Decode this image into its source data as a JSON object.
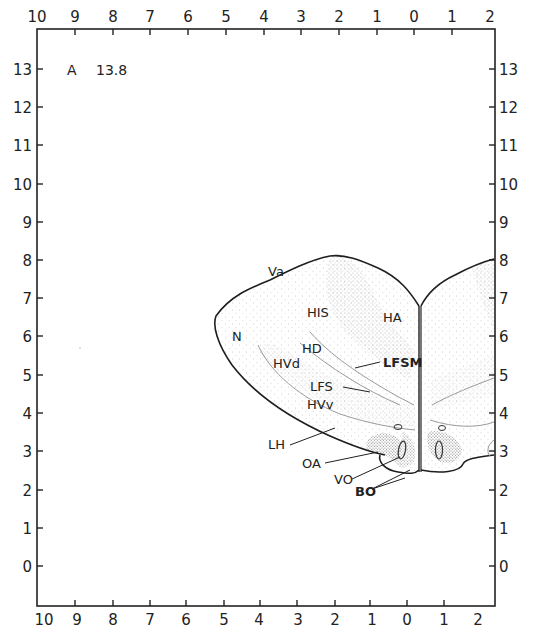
{
  "plate": {
    "section_prefix": "A",
    "section_value": "13.8"
  },
  "axes": {
    "top_ticks": [
      "10",
      "9",
      "8",
      "7",
      "6",
      "5",
      "4",
      "3",
      "2",
      "1",
      "0",
      "1",
      "2"
    ],
    "bottom_ticks": [
      "10",
      "9",
      "8",
      "7",
      "6",
      "5",
      "4",
      "3",
      "2",
      "1",
      "0",
      "1",
      "2"
    ],
    "left_ticks": [
      "13",
      "12",
      "11",
      "10",
      "9",
      "8",
      "7",
      "6",
      "5",
      "4",
      "3",
      "2",
      "1",
      "0"
    ],
    "right_ticks": [
      "13",
      "12",
      "11",
      "10",
      "9",
      "8",
      "7",
      "6",
      "5",
      "4",
      "3",
      "2",
      "1",
      "0"
    ]
  },
  "regions": {
    "va": "Va",
    "n": "N",
    "his": "HIS",
    "ha": "HA",
    "hd": "HD",
    "hvd": "HVd",
    "lfsm": "LFSM",
    "lfs": "LFS",
    "hvv": "HVv",
    "lh": "LH",
    "oa": "OA",
    "vo": "VO",
    "bo": "BO"
  },
  "colors": {
    "ink": "#1e1e1e",
    "stipple": "#8a8a8a",
    "background": "#ffffff"
  }
}
